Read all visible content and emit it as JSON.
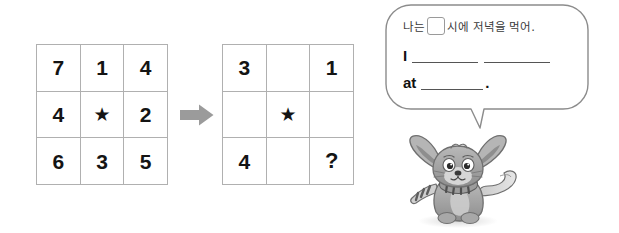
{
  "worksheet": {
    "left_grid": {
      "name": "number-grid-filled",
      "rows": [
        [
          "7",
          "1",
          "4"
        ],
        [
          "4",
          "★",
          "2"
        ],
        [
          "6",
          "3",
          "5"
        ]
      ]
    },
    "right_grid": {
      "name": "number-grid-blank",
      "rows": [
        [
          "3",
          "",
          "1"
        ],
        [
          "",
          "★",
          ""
        ],
        [
          "4",
          "",
          "?"
        ]
      ]
    },
    "arrow": {
      "icon": "arrow-right-icon",
      "color": "#9b9b9b"
    },
    "speech_bubble": {
      "korean": {
        "before_box": "나는",
        "after_box": "시에 저녁을 먹어."
      },
      "english": {
        "line1_lead": "I",
        "line2_lead": "at",
        "period": "."
      }
    },
    "character": {
      "name": "fox-cat-character",
      "description": "gray cartoon fox with striped scarf"
    }
  },
  "colors": {
    "grid_line": "#b0b0b0",
    "text": "#141414",
    "bubble_border": "#8c8c8c",
    "blank_line": "#555555",
    "arrow": "#9b9b9b"
  }
}
